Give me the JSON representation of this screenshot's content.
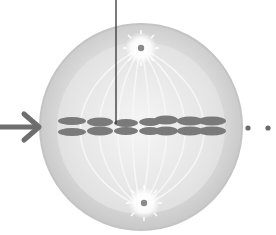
{
  "diagram": {
    "colors": {
      "background": "#ffffff",
      "cell_outer": "#c9c9c9",
      "cell_inner": "#dcdcdc",
      "cell_center": "#efefef",
      "spindle_fiber": "#f4f4f4",
      "chromosome": "#7a7a7a",
      "centrosome_core": "#8a8a8a",
      "centrosome_glow": "#ffffff",
      "arrow": "#6e6e6e",
      "pointer_line": "#333333",
      "dots": "#6a6a6a"
    },
    "elements": [
      {
        "name": "cell",
        "description": "round cell with spindle apparatus"
      },
      {
        "name": "centrosome-top",
        "description": "upper spindle pole"
      },
      {
        "name": "centrosome-bottom",
        "description": "lower spindle pole"
      },
      {
        "name": "spindle-fibers",
        "description": "fibers connecting poles"
      },
      {
        "name": "chromosomes",
        "description": "chromosomes aligned at metaphase plate",
        "count": 4
      },
      {
        "name": "pointer-line",
        "description": "leader line pointing to metaphase plate"
      },
      {
        "name": "arrow",
        "description": "arrow pointing right into cell"
      },
      {
        "name": "continuation-dots",
        "description": "two dots indicating continuation"
      }
    ]
  }
}
